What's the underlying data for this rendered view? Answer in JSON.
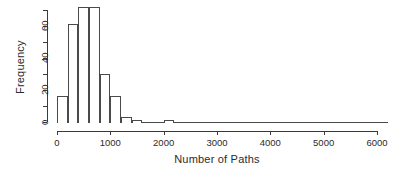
{
  "chart_data": {
    "type": "bar",
    "title": "",
    "subtitle": "",
    "xlabel": "Number of Paths",
    "ylabel": "Frequency",
    "xlim": [
      0,
      6200
    ],
    "ylim": [
      0,
      75
    ],
    "grid": false,
    "legend": null,
    "bin_width": 200,
    "x_ticks": [
      0,
      1000,
      2000,
      3000,
      4000,
      5000,
      6000
    ],
    "x_tick_labels": [
      "0",
      "1000",
      "2000",
      "3000",
      "4000",
      "5000",
      "6000"
    ],
    "y_ticks": [
      0,
      10,
      20,
      30,
      40,
      50,
      60,
      70
    ],
    "y_tick_labels": [
      "0",
      "",
      "20",
      "",
      "40",
      "",
      "60",
      ""
    ],
    "bins": [
      {
        "x0": 0,
        "x1": 200,
        "value": 16
      },
      {
        "x0": 200,
        "x1": 400,
        "value": 61
      },
      {
        "x0": 400,
        "x1": 600,
        "value": 72
      },
      {
        "x0": 600,
        "x1": 800,
        "value": 72
      },
      {
        "x0": 800,
        "x1": 1000,
        "value": 30
      },
      {
        "x0": 1000,
        "x1": 1200,
        "value": 16
      },
      {
        "x0": 1200,
        "x1": 1400,
        "value": 3
      },
      {
        "x0": 1400,
        "x1": 1600,
        "value": 1
      },
      {
        "x0": 1600,
        "x1": 1800,
        "value": 0
      },
      {
        "x0": 1800,
        "x1": 2000,
        "value": 0
      },
      {
        "x0": 2000,
        "x1": 2200,
        "value": 1
      },
      {
        "x0": 2200,
        "x1": 2400,
        "value": 0
      },
      {
        "x0": 2400,
        "x1": 2600,
        "value": 0
      },
      {
        "x0": 2600,
        "x1": 2800,
        "value": 0
      },
      {
        "x0": 2800,
        "x1": 3000,
        "value": 0
      },
      {
        "x0": 3000,
        "x1": 3200,
        "value": 0
      },
      {
        "x0": 3200,
        "x1": 3400,
        "value": 0
      },
      {
        "x0": 3400,
        "x1": 3600,
        "value": 0
      },
      {
        "x0": 3600,
        "x1": 3800,
        "value": 0
      },
      {
        "x0": 3800,
        "x1": 4000,
        "value": 0
      },
      {
        "x0": 4000,
        "x1": 4200,
        "value": 0
      },
      {
        "x0": 4200,
        "x1": 4400,
        "value": 0
      },
      {
        "x0": 4400,
        "x1": 4600,
        "value": 0
      },
      {
        "x0": 4600,
        "x1": 4800,
        "value": 0
      },
      {
        "x0": 4800,
        "x1": 5000,
        "value": 0
      },
      {
        "x0": 5000,
        "x1": 5200,
        "value": 0
      },
      {
        "x0": 5200,
        "x1": 5400,
        "value": 0
      },
      {
        "x0": 5400,
        "x1": 5600,
        "value": 0
      },
      {
        "x0": 5600,
        "x1": 5800,
        "value": 0
      },
      {
        "x0": 5800,
        "x1": 6000,
        "value": 0
      },
      {
        "x0": 6000,
        "x1": 6200,
        "value": 0
      }
    ],
    "categories": [
      "0-200",
      "200-400",
      "400-600",
      "600-800",
      "800-1000",
      "1000-1200",
      "1200-1400",
      "1400-1600",
      "1600-1800",
      "1800-2000",
      "2000-2200",
      "2200-2400",
      "2400-2600",
      "2600-2800",
      "2800-3000",
      "3000-3200",
      "3200-3400",
      "3400-3600",
      "3600-3800",
      "3800-4000",
      "4000-4200",
      "4200-4400",
      "4400-4600",
      "4600-4800",
      "4800-5000",
      "5000-5200",
      "5200-5400",
      "5400-5600",
      "5600-5800",
      "5800-6000",
      "6000-6200"
    ],
    "values": [
      16,
      61,
      72,
      72,
      30,
      16,
      3,
      1,
      0,
      0,
      1,
      0,
      0,
      0,
      0,
      0,
      0,
      0,
      0,
      0,
      0,
      0,
      0,
      0,
      0,
      0,
      0,
      0,
      0,
      0,
      0
    ],
    "colors": {
      "bar_stroke": "#4a4a4a",
      "bar_fill": "transparent",
      "axis": "#3a3a3a",
      "text": "#2b2b2b",
      "background": "#ffffff"
    }
  },
  "geometry": {
    "x0_px": 57,
    "x_per_unit": 0.05333,
    "y0_px": 122,
    "y_per_unit": 1.6
  }
}
